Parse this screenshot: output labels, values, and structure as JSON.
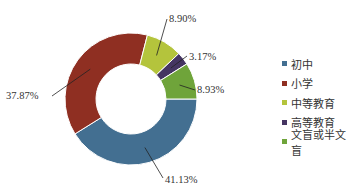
{
  "chart_data": {
    "type": "pie",
    "variant": "donut",
    "title": "",
    "categories": [
      "初中",
      "小学",
      "中等教育",
      "高等教育",
      "文盲或半文盲"
    ],
    "values": [
      41.13,
      37.87,
      8.9,
      3.17,
      8.93
    ],
    "value_labels": [
      "41.13%",
      "37.87%",
      "8.90%",
      "3.17%",
      "8.93%"
    ],
    "unit": "%",
    "colors": [
      "#436f91",
      "#8f2f22",
      "#b4c43c",
      "#453562",
      "#6fa43a"
    ],
    "legend_position": "right",
    "start_angle": "3 o'clock",
    "direction": "clockwise"
  }
}
